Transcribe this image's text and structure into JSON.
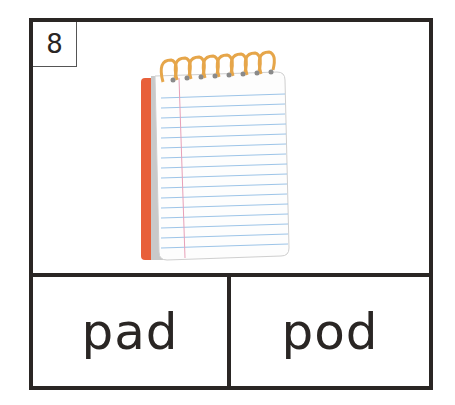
{
  "card": {
    "number": "8",
    "image": "notepad-icon",
    "choices": [
      "pad",
      "pod"
    ]
  },
  "colors": {
    "border": "#2a2624",
    "cover": "#e8603a",
    "spiral": "#e6a64a",
    "lines": "#9cc4e8",
    "margin": "#e8a0b8"
  }
}
